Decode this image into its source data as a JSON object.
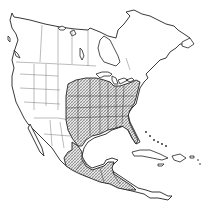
{
  "map": {
    "type": "species-range-map",
    "region": "North America, Central America and Caribbean",
    "style": "line-art outline with state/province borders",
    "range_fill": "cross-hatched",
    "colors": {
      "background": "#ffffff",
      "outline": "#222222",
      "borders": "#666666",
      "range_hatch": "#555555"
    },
    "range_regions": [
      "Eastern United States (Great Plains east to Atlantic coast, Great Lakes south to Gulf Coast and Florida)",
      "Eastern Mexico (Gulf coastal lowlands)",
      "Southern Mexico and Central America"
    ],
    "text_labels": []
  }
}
